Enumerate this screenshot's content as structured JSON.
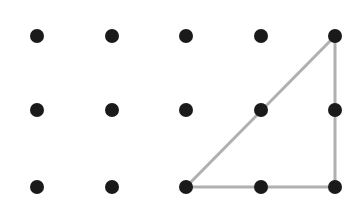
{
  "diagram": {
    "type": "dot-grid-with-triangle",
    "background": "#ffffff",
    "dot_color": "#1a1a1a",
    "dot_radius": 7,
    "line_color": "#b0b0b0",
    "line_width": 3,
    "columns_x": [
      37,
      112,
      186,
      261,
      335
    ],
    "rows_y": [
      36,
      110,
      187
    ],
    "dots": [
      {
        "row": 0,
        "col": 0
      },
      {
        "row": 0,
        "col": 1
      },
      {
        "row": 0,
        "col": 2
      },
      {
        "row": 0,
        "col": 3
      },
      {
        "row": 0,
        "col": 4
      },
      {
        "row": 1,
        "col": 0
      },
      {
        "row": 1,
        "col": 1
      },
      {
        "row": 1,
        "col": 2
      },
      {
        "row": 1,
        "col": 3
      },
      {
        "row": 1,
        "col": 4
      },
      {
        "row": 2,
        "col": 0
      },
      {
        "row": 2,
        "col": 1
      },
      {
        "row": 2,
        "col": 2
      },
      {
        "row": 2,
        "col": 3
      },
      {
        "row": 2,
        "col": 4
      }
    ],
    "triangle": {
      "vertices": [
        {
          "row": 2,
          "col": 2
        },
        {
          "row": 0,
          "col": 4
        },
        {
          "row": 2,
          "col": 4
        }
      ]
    }
  }
}
